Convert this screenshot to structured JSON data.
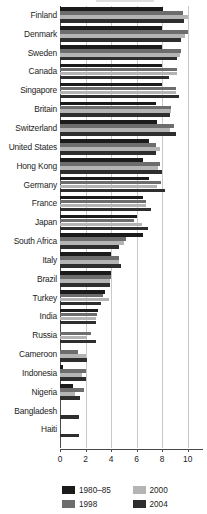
{
  "chart_data": {
    "type": "bar",
    "orientation": "horizontal",
    "title": "",
    "subtitle": "",
    "xlabel": "",
    "ylabel": "",
    "xlim": [
      0,
      11.2
    ],
    "xticks": [
      0,
      2,
      4,
      6,
      8,
      10
    ],
    "xticklabels": [
      "0",
      "2",
      "4",
      "6",
      "8",
      "10"
    ],
    "grid": true,
    "grid_axis": "x",
    "legend_position": "bottom",
    "categories": [
      "Finland",
      "Denmark",
      "Sweden",
      "Canada",
      "Singapore",
      "Britain",
      "Switzerland",
      "United States",
      "Hong Kong",
      "Germany",
      "France",
      "Japan",
      "South Africa",
      "Italy",
      "Brazil",
      "Turkey",
      "India",
      "Russia",
      "Cameroon",
      "Indonesia",
      "Nigeria",
      "Bangladesh",
      "Haiti"
    ],
    "series": [
      {
        "name": "1980–85",
        "color": "#1b1b1b",
        "values": [
          8.1,
          8.0,
          8.0,
          8.0,
          8.0,
          7.5,
          7.6,
          7.0,
          6.5,
          7.0,
          6.5,
          6.0,
          6.5,
          4.0,
          4.0,
          3.5,
          3.0,
          0.0,
          0.0,
          0.2,
          1.0,
          0.0,
          0.0
        ]
      },
      {
        "name": "1998",
        "color": "#6d6d6d",
        "values": [
          9.6,
          10.0,
          9.5,
          9.2,
          9.1,
          8.7,
          8.9,
          7.5,
          7.8,
          7.9,
          6.7,
          5.8,
          5.2,
          4.6,
          4.0,
          3.4,
          2.9,
          2.4,
          1.4,
          2.0,
          1.9,
          0.0,
          0.0
        ]
      },
      {
        "name": "2000",
        "color": "#b4b4b4",
        "values": [
          10.0,
          9.8,
          9.4,
          9.2,
          9.1,
          8.7,
          8.6,
          7.8,
          7.7,
          7.6,
          6.7,
          6.4,
          5.0,
          4.6,
          3.9,
          3.8,
          2.8,
          2.1,
          2.0,
          1.7,
          1.2,
          0.0,
          0.0
        ]
      },
      {
        "name": "2004",
        "color": "#2e2e2e",
        "values": [
          9.7,
          9.5,
          9.2,
          8.5,
          9.3,
          8.6,
          9.1,
          7.5,
          8.0,
          8.2,
          7.1,
          6.9,
          4.6,
          4.8,
          3.9,
          3.2,
          2.8,
          2.8,
          2.1,
          2.0,
          1.6,
          1.5,
          1.5
        ]
      }
    ],
    "bars": [
      {
        "category": "Finland",
        "values": [
          8.1,
          9.6,
          10.0,
          9.7
        ]
      },
      {
        "category": "Denmark",
        "values": [
          8.0,
          10.0,
          9.8,
          9.5
        ]
      },
      {
        "category": "Sweden",
        "values": [
          8.0,
          9.5,
          9.4,
          9.2
        ]
      },
      {
        "category": "Canada",
        "values": [
          8.0,
          9.2,
          9.2,
          8.5
        ]
      },
      {
        "category": "Singapore",
        "values": [
          8.0,
          9.1,
          9.1,
          9.3
        ]
      },
      {
        "category": "Britain",
        "values": [
          7.5,
          8.7,
          8.7,
          8.6
        ]
      },
      {
        "category": "Switzerland",
        "values": [
          7.6,
          8.9,
          8.6,
          9.1
        ]
      },
      {
        "category": "United States",
        "values": [
          7.0,
          7.5,
          7.8,
          7.5
        ]
      },
      {
        "category": "Hong Kong",
        "values": [
          6.5,
          7.8,
          7.7,
          8.0
        ]
      },
      {
        "category": "Germany",
        "values": [
          7.0,
          7.9,
          7.6,
          8.2
        ]
      },
      {
        "category": "France",
        "values": [
          6.5,
          6.7,
          6.7,
          7.1
        ]
      },
      {
        "category": "Japan",
        "values": [
          6.0,
          5.8,
          6.4,
          6.9
        ]
      },
      {
        "category": "South Africa",
        "values": [
          6.5,
          5.2,
          5.0,
          4.6
        ]
      },
      {
        "category": "Italy",
        "values": [
          4.0,
          4.6,
          4.6,
          4.8
        ]
      },
      {
        "category": "Brazil",
        "values": [
          4.0,
          4.0,
          3.9,
          3.9
        ]
      },
      {
        "category": "Turkey",
        "values": [
          3.5,
          3.4,
          3.8,
          3.2
        ]
      },
      {
        "category": "India",
        "values": [
          3.0,
          2.9,
          2.8,
          2.8
        ]
      },
      {
        "category": "Russia",
        "values": [
          0.0,
          2.4,
          2.1,
          2.8
        ]
      },
      {
        "category": "Cameroon",
        "values": [
          0.0,
          1.4,
          2.0,
          2.1
        ]
      },
      {
        "category": "Indonesia",
        "values": [
          0.2,
          2.0,
          1.7,
          2.0
        ]
      },
      {
        "category": "Nigeria",
        "values": [
          1.0,
          1.9,
          1.2,
          1.6
        ]
      },
      {
        "category": "Bangladesh",
        "values": [
          0.0,
          0.0,
          0.0,
          1.5
        ]
      },
      {
        "category": "Haiti",
        "values": [
          0.0,
          0.0,
          0.0,
          1.5
        ]
      }
    ]
  },
  "legend": {
    "items": [
      {
        "label": "1980–85",
        "color": "#1b1b1b"
      },
      {
        "label": "2000",
        "color": "#b4b4b4"
      },
      {
        "label": "1998",
        "color": "#6d6d6d"
      },
      {
        "label": "2004",
        "color": "#2e2e2e"
      }
    ]
  }
}
